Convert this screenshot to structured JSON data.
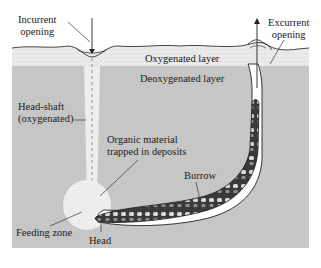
{
  "diagram": {
    "type": "cross-section",
    "labels": {
      "incurrent_opening": [
        "Incurrent",
        "opening"
      ],
      "excurrent_opening": [
        "Excurrent",
        "opening"
      ],
      "oxygenated_layer": "Oxygenated layer",
      "deoxygenated_layer": "Deoxygenated layer",
      "head_shaft": [
        "Head-shaft",
        "(oxygenated)"
      ],
      "organic_material": [
        "Organic material",
        "trapped in deposits"
      ],
      "burrow": "Burrow",
      "feeding_zone": "Feeding zone",
      "head": "Head"
    },
    "colors": {
      "background": "#ffffff",
      "oxygenated_layer": "#e6e6e6",
      "deoxygenated_layer": "#c4c4c4",
      "head_shaft": "#efefef",
      "burrow_fill": "#ffffff",
      "worm_dark": "#2a2a2a",
      "line": "#222222"
    }
  }
}
